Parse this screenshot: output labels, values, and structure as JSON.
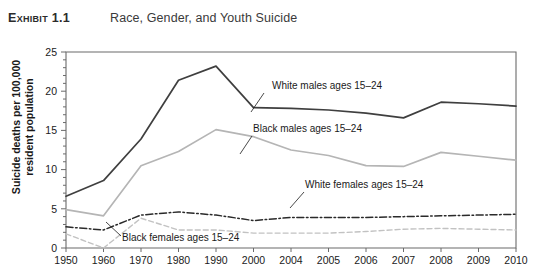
{
  "header": {
    "exhibit_label": "Exhibit 1.1",
    "title": "Race, Gender, and Youth Suicide"
  },
  "axes": {
    "ylabel_line1": "Suicide deaths per 100,000",
    "ylabel_line2": "resident population",
    "y_ticks": [
      "0",
      "5",
      "10",
      "15",
      "20",
      "25"
    ],
    "x_ticks": [
      "1950",
      "1960",
      "1970",
      "1980",
      "1990",
      "2000",
      "2004",
      "2005",
      "2006",
      "2007",
      "2008",
      "2009",
      "2010"
    ]
  },
  "annotations": {
    "white_males": "White males ages 15–24",
    "black_males": "Black males ages 15–24",
    "white_females": "White females ages 15–24",
    "black_females": "Black females ages 15–24"
  },
  "colors": {
    "white_males": "#3f3f3f",
    "black_males": "#b5b5b5",
    "white_females": "#2a2a2a",
    "black_females": "#c2c2c2",
    "axis": "#6b6b6b"
  },
  "chart_data": {
    "type": "line",
    "title": "Race, Gender, and Youth Suicide",
    "xlabel": "",
    "ylabel": "Suicide deaths per 100,000 resident population",
    "ylim": [
      0,
      25
    ],
    "ytick_step": 5,
    "minor_tick_step": 1,
    "grid": false,
    "legend": "inline-annotations",
    "categories": [
      "1950",
      "1960",
      "1970",
      "1980",
      "1990",
      "2000",
      "2004",
      "2005",
      "2006",
      "2007",
      "2008",
      "2009",
      "2010"
    ],
    "series": [
      {
        "name": "White males ages 15–24",
        "style": "solid",
        "color": "#3f3f3f",
        "values": [
          6.6,
          8.6,
          13.9,
          21.4,
          23.2,
          17.9,
          17.8,
          17.6,
          17.2,
          16.6,
          18.6,
          18.4,
          18.1
        ]
      },
      {
        "name": "Black males ages 15–24",
        "style": "solid",
        "color": "#b5b5b5",
        "values": [
          4.9,
          4.1,
          10.5,
          12.3,
          15.1,
          14.2,
          12.5,
          11.8,
          10.5,
          10.4,
          12.2,
          11.7,
          11.2
        ]
      },
      {
        "name": "White females ages 15–24",
        "style": "dash-dot",
        "color": "#2a2a2a",
        "values": [
          2.7,
          2.3,
          4.2,
          4.6,
          4.2,
          3.5,
          3.9,
          3.9,
          3.9,
          4.0,
          4.1,
          4.2,
          4.3
        ]
      },
      {
        "name": "Black females ages 15–24",
        "style": "dashed",
        "color": "#c2c2c2",
        "values": [
          1.8,
          0.0,
          3.8,
          2.3,
          2.3,
          1.9,
          1.9,
          1.9,
          2.1,
          2.4,
          2.5,
          2.4,
          2.3
        ]
      }
    ]
  }
}
